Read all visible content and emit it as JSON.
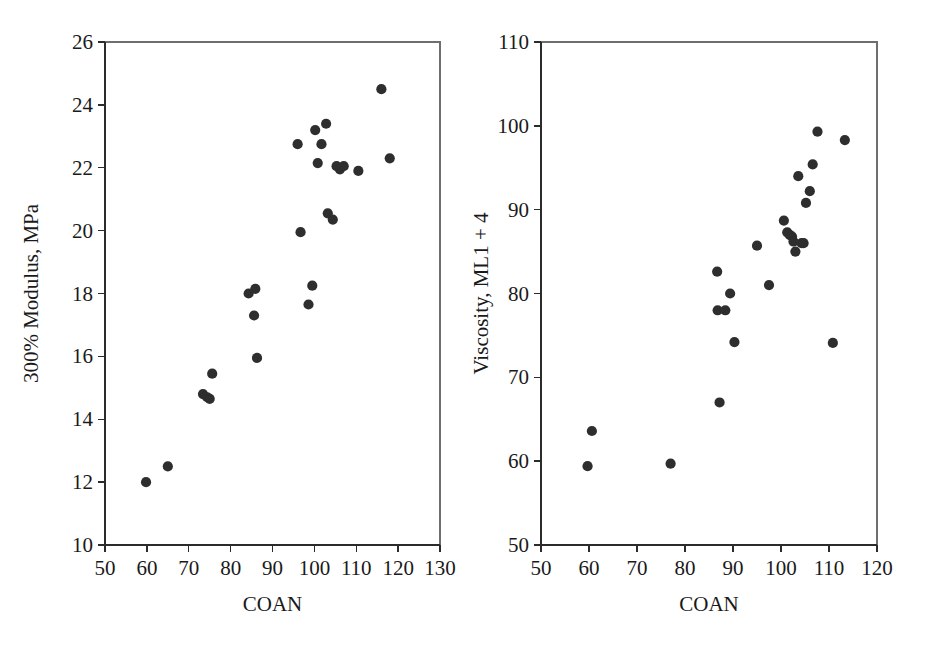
{
  "figure": {
    "panel_count": 2,
    "marker_color": "#2e2e2e",
    "axis_color": "#2b2b2b",
    "background": "#ffffff"
  },
  "chart_data": [
    {
      "type": "scatter",
      "title": "",
      "xlabel": "COAN",
      "ylabel": "300% Modulus, MPa",
      "xlim": [
        50,
        130
      ],
      "ylim": [
        10,
        26
      ],
      "xticks": [
        50,
        60,
        70,
        80,
        90,
        100,
        110,
        120,
        130
      ],
      "yticks": [
        10,
        12,
        14,
        16,
        18,
        20,
        22,
        24,
        26
      ],
      "grid": false,
      "legend": "none",
      "x": [
        59.8,
        65.0,
        73.4,
        74.4,
        75.0,
        75.6,
        84.3,
        85.6,
        85.9,
        86.3,
        96.0,
        96.7,
        98.6,
        99.5,
        100.2,
        100.8,
        101.7,
        102.8,
        103.2,
        104.4,
        105.3,
        106.1,
        107.0,
        110.5,
        116.0,
        118.0
      ],
      "y": [
        12.0,
        12.5,
        14.8,
        14.7,
        14.65,
        15.45,
        18.0,
        17.3,
        18.15,
        15.95,
        22.75,
        19.95,
        17.65,
        18.25,
        23.2,
        22.15,
        22.75,
        23.4,
        20.55,
        20.35,
        22.05,
        21.95,
        22.05,
        21.9,
        24.5,
        22.3
      ],
      "points": [
        {
          "x": 59.8,
          "y": 12.0
        },
        {
          "x": 65.0,
          "y": 12.5
        },
        {
          "x": 73.4,
          "y": 14.8
        },
        {
          "x": 74.4,
          "y": 14.7
        },
        {
          "x": 75.0,
          "y": 14.65
        },
        {
          "x": 75.6,
          "y": 15.45
        },
        {
          "x": 84.3,
          "y": 18.0
        },
        {
          "x": 85.6,
          "y": 17.3
        },
        {
          "x": 85.9,
          "y": 18.15
        },
        {
          "x": 86.3,
          "y": 15.95
        },
        {
          "x": 96.0,
          "y": 22.75
        },
        {
          "x": 96.7,
          "y": 19.95
        },
        {
          "x": 98.6,
          "y": 17.65
        },
        {
          "x": 99.5,
          "y": 18.25
        },
        {
          "x": 100.2,
          "y": 23.2
        },
        {
          "x": 100.8,
          "y": 22.15
        },
        {
          "x": 101.7,
          "y": 22.75
        },
        {
          "x": 102.8,
          "y": 23.4
        },
        {
          "x": 103.2,
          "y": 20.55
        },
        {
          "x": 104.4,
          "y": 20.35
        },
        {
          "x": 105.3,
          "y": 22.05
        },
        {
          "x": 106.1,
          "y": 21.95
        },
        {
          "x": 107.0,
          "y": 22.05
        },
        {
          "x": 110.5,
          "y": 21.9
        },
        {
          "x": 116.0,
          "y": 24.5
        },
        {
          "x": 118.0,
          "y": 22.3
        }
      ]
    },
    {
      "type": "scatter",
      "title": "",
      "xlabel": "COAN",
      "ylabel": "Viscosity, ML1 + 4",
      "xlim": [
        50,
        120
      ],
      "ylim": [
        50,
        110
      ],
      "xticks": [
        50,
        60,
        70,
        80,
        90,
        100,
        110,
        120
      ],
      "yticks": [
        50,
        60,
        70,
        80,
        90,
        100,
        110
      ],
      "grid": false,
      "legend": "none",
      "x": [
        59.7,
        60.6,
        77.0,
        86.7,
        86.8,
        87.2,
        88.4,
        89.4,
        90.3,
        90.6,
        95.0,
        97.5,
        100.6,
        101.3,
        101.8,
        102.3,
        102.6,
        103.0,
        103.6,
        104.3,
        104.7,
        105.2,
        106.0,
        106.6,
        107.6,
        110.8,
        113.3
      ],
      "y": [
        59.4,
        63.6,
        59.7,
        82.6,
        78.0,
        67.0,
        78.0,
        80.0,
        74.2,
        74.2,
        85.7,
        81.0,
        88.7,
        87.3,
        87.0,
        86.8,
        86.2,
        85.0,
        94.0,
        86.0,
        86.0,
        90.8,
        92.2,
        95.4,
        99.3,
        74.1,
        98.3
      ],
      "points": [
        {
          "x": 59.7,
          "y": 59.4
        },
        {
          "x": 60.6,
          "y": 63.6
        },
        {
          "x": 77.0,
          "y": 59.7
        },
        {
          "x": 86.7,
          "y": 82.6
        },
        {
          "x": 86.8,
          "y": 78.0
        },
        {
          "x": 87.2,
          "y": 67.0
        },
        {
          "x": 88.4,
          "y": 78.0
        },
        {
          "x": 89.4,
          "y": 80.0
        },
        {
          "x": 90.3,
          "y": 74.2
        },
        {
          "x": 95.0,
          "y": 85.7
        },
        {
          "x": 97.5,
          "y": 81.0
        },
        {
          "x": 100.6,
          "y": 88.7
        },
        {
          "x": 101.3,
          "y": 87.3
        },
        {
          "x": 101.8,
          "y": 87.0
        },
        {
          "x": 102.3,
          "y": 86.8
        },
        {
          "x": 102.6,
          "y": 86.2
        },
        {
          "x": 103.0,
          "y": 85.0
        },
        {
          "x": 103.6,
          "y": 94.0
        },
        {
          "x": 104.3,
          "y": 86.0
        },
        {
          "x": 104.7,
          "y": 86.0
        },
        {
          "x": 105.2,
          "y": 90.8
        },
        {
          "x": 106.0,
          "y": 92.2
        },
        {
          "x": 106.6,
          "y": 95.4
        },
        {
          "x": 107.6,
          "y": 99.3
        },
        {
          "x": 110.8,
          "y": 74.1
        },
        {
          "x": 113.3,
          "y": 98.3
        }
      ]
    }
  ]
}
